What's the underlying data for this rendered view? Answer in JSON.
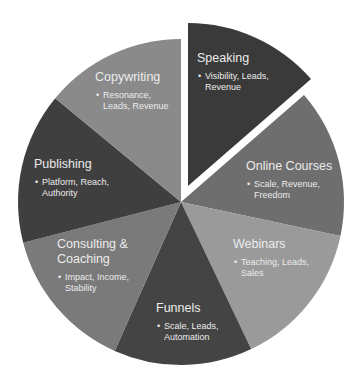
{
  "diagram": {
    "type": "pie",
    "center": [
      181,
      202
    ],
    "radius": 163,
    "slices": [
      {
        "name": "speaking",
        "title": "Speaking",
        "bullet": "Visibility, Leads, Revenue",
        "start_deg": -90,
        "end_deg": -41,
        "color": "#3a3a3a",
        "exploded": true,
        "explode_offset": [
          7,
          -16
        ],
        "label_pos": [
          197,
          51
        ],
        "label_width": 80
      },
      {
        "name": "online-courses",
        "title": "Online Courses",
        "bullet": "Scale, Revenue, Freedom",
        "start_deg": -41,
        "end_deg": 12,
        "color": "#6e6e6e",
        "exploded": false,
        "label_pos": [
          246,
          159
        ],
        "label_width": 92
      },
      {
        "name": "webinars",
        "title": "Webinars",
        "bullet": "Teaching, Leads, Sales",
        "start_deg": 12,
        "end_deg": 64.5,
        "color": "#9a9a9a",
        "exploded": false,
        "label_pos": [
          233,
          237
        ],
        "label_width": 85
      },
      {
        "name": "funnels",
        "title": "Funnels",
        "bullet": "Scale, Leads, Automation",
        "start_deg": 64.5,
        "end_deg": 114,
        "color": "#444444",
        "exploded": false,
        "label_pos": [
          156,
          301
        ],
        "label_width": 80
      },
      {
        "name": "consulting-coaching",
        "title": "Consulting & Coaching",
        "bullet": "Impact, Income, Stability",
        "start_deg": 114,
        "end_deg": 165.5,
        "color": "#7a7a7a",
        "exploded": false,
        "label_pos": [
          57,
          237
        ],
        "label_width": 78
      },
      {
        "name": "publishing",
        "title": "Publishing",
        "bullet": "Platform, Reach, Authority",
        "start_deg": 165.5,
        "end_deg": 219.5,
        "color": "#3f3f3f",
        "exploded": false,
        "label_pos": [
          34,
          157
        ],
        "label_width": 82
      },
      {
        "name": "copywriting",
        "title": "Copywriting",
        "bullet": "Resonance, Leads, Revenue",
        "start_deg": 219.5,
        "end_deg": 270,
        "color": "#8a8a8a",
        "exploded": false,
        "label_pos": [
          95,
          70
        ],
        "label_width": 80
      }
    ]
  },
  "chart_data": {
    "type": "pie",
    "title": "",
    "categories": [
      "Speaking",
      "Online Courses",
      "Webinars",
      "Funnels",
      "Consulting & Coaching",
      "Publishing",
      "Copywriting"
    ],
    "values": [
      13.6,
      14.7,
      14.6,
      13.8,
      14.3,
      15.0,
      14.0
    ],
    "descriptions": [
      "Visibility, Leads, Revenue",
      "Scale, Revenue, Freedom",
      "Teaching, Leads, Sales",
      "Scale, Leads, Automation",
      "Impact, Income, Stability",
      "Platform, Reach, Authority",
      "Resonance, Leads, Revenue"
    ],
    "exploded": [
      "Speaking"
    ],
    "legend": "none"
  }
}
